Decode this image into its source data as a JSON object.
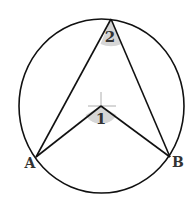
{
  "diagram": {
    "type": "circle-inscribed-central-angle",
    "colors": {
      "stroke": "#111111",
      "angle_fill": "#d6d6d6",
      "label": "#333333",
      "crosshair": "#999999"
    },
    "circle": {
      "cx": 101,
      "cy": 106,
      "rx": 82,
      "ry": 87
    },
    "points": {
      "A": {
        "x": 36,
        "y": 157,
        "label": "A"
      },
      "B": {
        "x": 170,
        "y": 157,
        "label": "B"
      },
      "top": {
        "x": 111,
        "y": 19
      },
      "center": {
        "x": 101,
        "y": 106
      }
    },
    "angles": [
      {
        "id": "angle-1",
        "label": "1",
        "vertex": "center"
      },
      {
        "id": "angle-2",
        "label": "2",
        "vertex": "top"
      }
    ]
  }
}
